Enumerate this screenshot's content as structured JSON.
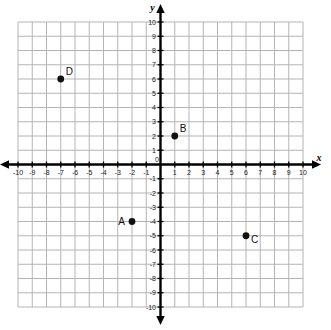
{
  "chart_data": {
    "type": "scatter",
    "title": "",
    "xlabel": "x",
    "ylabel": "y",
    "xlim": [
      -10,
      10
    ],
    "ylim": [
      -10,
      10
    ],
    "grid": true,
    "legend": "none",
    "x_ticks": [
      "-10",
      "-9",
      "-8",
      "-7",
      "-6",
      "-5",
      "-4",
      "-3",
      "-2",
      "-1",
      "0",
      "1",
      "2",
      "3",
      "4",
      "5",
      "6",
      "7",
      "8",
      "9",
      "10"
    ],
    "y_ticks": [
      "-10",
      "-9",
      "-8",
      "-7",
      "-6",
      "-5",
      "-4",
      "-3",
      "-2",
      "-1",
      "1",
      "2",
      "3",
      "4",
      "5",
      "6",
      "7",
      "8",
      "9",
      "10"
    ],
    "origin_label": "0",
    "points": [
      {
        "label": "A",
        "x": -2,
        "y": -4,
        "label_side": "left"
      },
      {
        "label": "B",
        "x": 1,
        "y": 2,
        "label_side": "upper-right"
      },
      {
        "label": "C",
        "x": 6,
        "y": -5,
        "label_side": "lower-right"
      },
      {
        "label": "D",
        "x": -7,
        "y": 6,
        "label_side": "upper-right"
      }
    ],
    "colors": {
      "grid": "#b4b4b4",
      "axis": "#000000",
      "point": "#111111",
      "background": "#ffffff"
    }
  }
}
